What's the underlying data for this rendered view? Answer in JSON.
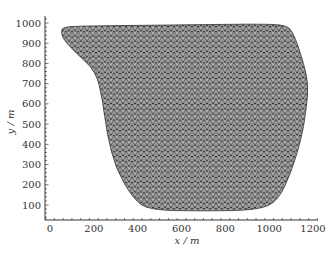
{
  "chart_data": {
    "type": "scatter",
    "title": "",
    "xlabel": "x / m",
    "ylabel": "y / m",
    "xlim": [
      -10,
      1260
    ],
    "ylim": [
      30,
      1040
    ],
    "xticks": [
      0,
      200,
      400,
      600,
      800,
      1000,
      1200
    ],
    "yticks": [
      100,
      200,
      300,
      400,
      500,
      600,
      700,
      800,
      900,
      1000
    ],
    "xtick_labels": [
      "0",
      "200",
      "400",
      "600",
      "800",
      "1000",
      "1200"
    ],
    "ytick_labels": [
      "100",
      "200",
      "300",
      "400",
      "500",
      "600",
      "700",
      "800",
      "900",
      "1000"
    ],
    "grid": false,
    "legend": null,
    "boundary_polygon_m": [
      [
        60,
        980
      ],
      [
        150,
        985
      ],
      [
        400,
        988
      ],
      [
        700,
        992
      ],
      [
        960,
        995
      ],
      [
        1080,
        990
      ],
      [
        1110,
        950
      ],
      [
        1150,
        830
      ],
      [
        1180,
        700
      ],
      [
        1170,
        580
      ],
      [
        1150,
        440
      ],
      [
        1100,
        260
      ],
      [
        1040,
        120
      ],
      [
        950,
        75
      ],
      [
        700,
        70
      ],
      [
        450,
        75
      ],
      [
        380,
        130
      ],
      [
        300,
        280
      ],
      [
        260,
        450
      ],
      [
        240,
        620
      ],
      [
        210,
        760
      ],
      [
        120,
        850
      ],
      [
        60,
        920
      ],
      [
        50,
        960
      ]
    ],
    "fill_color": "#8a8a8a",
    "node_color": "#222222"
  }
}
